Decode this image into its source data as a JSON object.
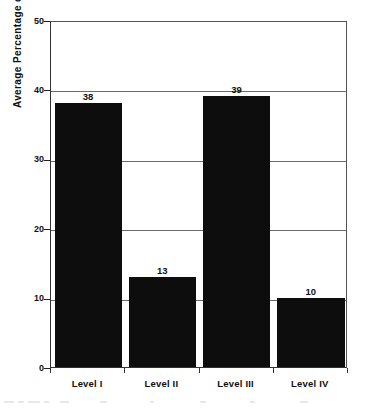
{
  "chart_data": {
    "type": "bar",
    "title": "",
    "subtitle": "",
    "xlabel": "",
    "ylabel": "Average Percentage of Minutes",
    "categories": [
      "Level I",
      "Level II",
      "Level III",
      "Level IV"
    ],
    "values": [
      38,
      13,
      39,
      10
    ],
    "data_labels": [
      "38",
      "13",
      "39",
      "10"
    ],
    "ylim": [
      0,
      50
    ],
    "ytick_labels": [
      "0",
      "10",
      "20",
      "30",
      "40",
      "50"
    ],
    "ytick_values": [
      0,
      10,
      20,
      30,
      40,
      50
    ],
    "grid": "horizontal",
    "legend": "none",
    "bar_color": "#0d0d0d",
    "gridline_color": "#6a6a6a",
    "axis_color": "#333333",
    "background_color": "#ffffff",
    "text_color": "#111111",
    "annotations": []
  }
}
